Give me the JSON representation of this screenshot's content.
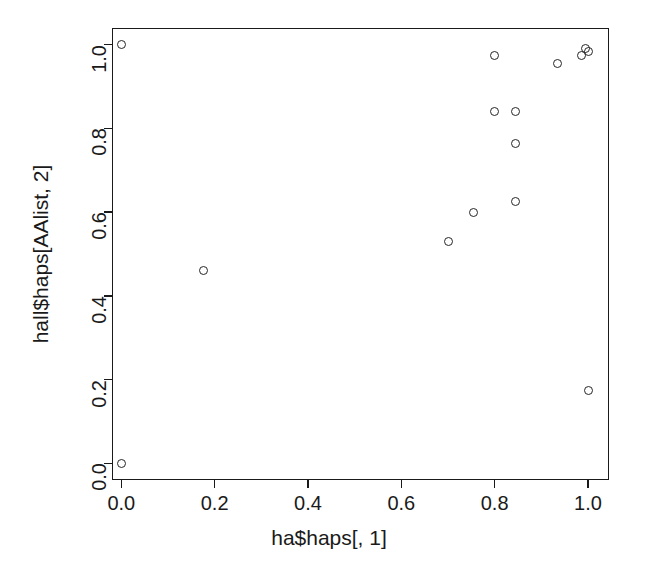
{
  "chart_data": {
    "type": "scatter",
    "title": "",
    "subtitle": "",
    "xlabel": "ha$haps[, 1]",
    "ylabel": "hall$haps[AAlist, 2]",
    "xlim": [
      -0.02,
      1.045
    ],
    "ylim": [
      -0.04,
      1.04
    ],
    "grid": false,
    "legend": null,
    "marker": "open-circle",
    "marker_color": "#262626",
    "xticks": [
      0.0,
      0.2,
      0.4,
      0.6,
      0.8,
      1.0
    ],
    "yticks": [
      0.0,
      0.2,
      0.4,
      0.6,
      0.8,
      1.0
    ],
    "xticklabels": [
      "0.0",
      "0.2",
      "0.4",
      "0.6",
      "0.8",
      "1.0"
    ],
    "yticklabels": [
      "0.0",
      "0.2",
      "0.4",
      "0.6",
      "0.8",
      "1.0"
    ],
    "n_points": 15,
    "x": [
      0.0,
      0.0,
      0.175,
      0.7,
      0.755,
      0.8,
      0.8,
      0.845,
      0.845,
      0.845,
      0.935,
      0.985,
      0.995,
      1.0,
      1.0
    ],
    "y": [
      1.0,
      0.0,
      0.46,
      0.53,
      0.6,
      0.975,
      0.84,
      0.84,
      0.765,
      0.625,
      0.955,
      0.975,
      0.99,
      0.985,
      0.175
    ],
    "points": [
      {
        "x": 0.0,
        "y": 1.0
      },
      {
        "x": 0.0,
        "y": 0.0
      },
      {
        "x": 0.175,
        "y": 0.46
      },
      {
        "x": 0.7,
        "y": 0.53
      },
      {
        "x": 0.755,
        "y": 0.6
      },
      {
        "x": 0.8,
        "y": 0.975
      },
      {
        "x": 0.8,
        "y": 0.84
      },
      {
        "x": 0.845,
        "y": 0.84
      },
      {
        "x": 0.845,
        "y": 0.765
      },
      {
        "x": 0.845,
        "y": 0.625
      },
      {
        "x": 0.935,
        "y": 0.955
      },
      {
        "x": 0.985,
        "y": 0.975
      },
      {
        "x": 0.995,
        "y": 0.99
      },
      {
        "x": 1.0,
        "y": 0.985
      },
      {
        "x": 1.0,
        "y": 0.175
      }
    ]
  }
}
